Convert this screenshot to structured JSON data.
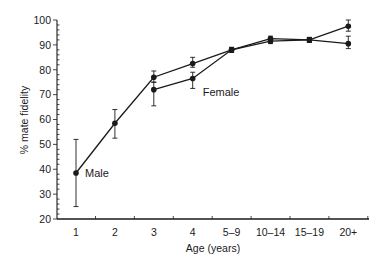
{
  "chart_data": {
    "type": "line",
    "title": "",
    "xlabel": "Age (years)",
    "ylabel": "% mate fidelity",
    "ylim": [
      20,
      100
    ],
    "yticks": [
      20,
      30,
      40,
      50,
      60,
      70,
      80,
      90,
      100
    ],
    "grid": false,
    "legend": "inline labels",
    "categories": [
      "1",
      "2",
      "3",
      "4",
      "5–9",
      "10–14",
      "15–19",
      "20+"
    ],
    "series": [
      {
        "name": "Male",
        "values": [
          38.5,
          58.5,
          77,
          82.5,
          88,
          91.5,
          92,
          97.5
        ],
        "err_low": [
          25,
          52.5,
          75,
          81,
          87,
          90.5,
          91,
          95.5
        ],
        "err_high": [
          52,
          64,
          79.5,
          85,
          89,
          92.5,
          93,
          100
        ],
        "label_at": 0
      },
      {
        "name": "Female",
        "values": [
          null,
          null,
          72,
          76.5,
          88,
          92.5,
          92,
          90.5
        ],
        "err_low": [
          null,
          null,
          65.5,
          72.5,
          87,
          91.5,
          91,
          88.5
        ],
        "err_high": [
          null,
          null,
          75,
          79,
          89,
          93.5,
          93,
          93.5
        ],
        "label_at": 3
      }
    ]
  }
}
